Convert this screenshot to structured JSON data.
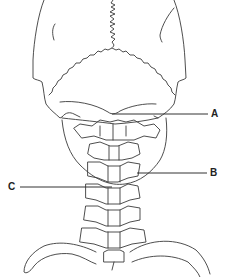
{
  "diagram": {
    "labels": [
      {
        "id": "A",
        "text": "A",
        "x": 211,
        "y": 110
      },
      {
        "id": "B",
        "text": "B",
        "x": 210,
        "y": 168
      },
      {
        "id": "C",
        "text": "C",
        "x": 8,
        "y": 182
      }
    ],
    "colors": {
      "line": "#3a3a3a",
      "background": "#ffffff"
    }
  }
}
